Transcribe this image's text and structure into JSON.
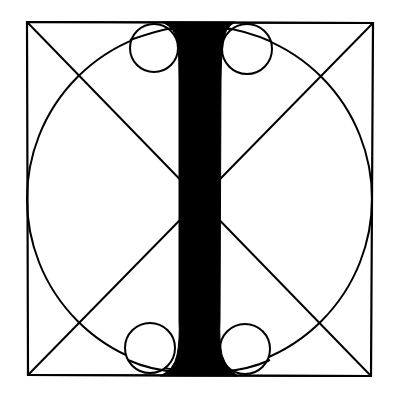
{
  "diagram": {
    "subject": "Geometric construction of the letter I",
    "letter": "I",
    "colors": {
      "background": "#ffffff",
      "ink": "#000000"
    },
    "frame": {
      "x1": 27,
      "y1": 22,
      "x2": 373,
      "y2": 376,
      "stroke_width": 2
    },
    "diagonals": [
      {
        "x1": 27,
        "y1": 22,
        "x2": 373,
        "y2": 376
      },
      {
        "x1": 373,
        "y1": 23,
        "x2": 28,
        "y2": 376
      }
    ],
    "great_circle": {
      "cx": 199,
      "cy": 199,
      "r": 172,
      "stroke_width": 2
    },
    "serif_circles": [
      {
        "position": "top-left",
        "cx": 154,
        "cy": 47,
        "r": 24
      },
      {
        "position": "top-right",
        "cx": 247,
        "cy": 49,
        "r": 25
      },
      {
        "position": "bottom-left",
        "cx": 150,
        "cy": 348,
        "r": 25
      },
      {
        "position": "bottom-right",
        "cx": 245,
        "cy": 349,
        "r": 25
      }
    ],
    "stem": {
      "top_y": 22,
      "bottom_y": 376,
      "mid_left_x": 179,
      "mid_right_x": 220
    }
  }
}
